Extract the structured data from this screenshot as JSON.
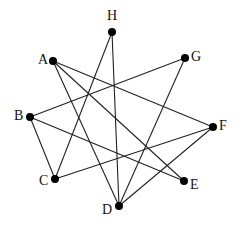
{
  "graph": {
    "nodes": [
      {
        "id": "H",
        "label": "H",
        "x": 112,
        "y": 32,
        "label_dx": -5,
        "label_dy": -23
      },
      {
        "id": "A",
        "label": "A",
        "x": 53,
        "y": 61,
        "label_dx": -15,
        "label_dy": -8
      },
      {
        "id": "G",
        "label": "G",
        "x": 185,
        "y": 58,
        "label_dx": 6,
        "label_dy": -8
      },
      {
        "id": "B",
        "label": "B",
        "x": 30,
        "y": 117,
        "label_dx": -16,
        "label_dy": -8
      },
      {
        "id": "F",
        "label": "F",
        "x": 213,
        "y": 127,
        "label_dx": 6,
        "label_dy": -8
      },
      {
        "id": "C",
        "label": "C",
        "x": 55,
        "y": 179,
        "label_dx": -16,
        "label_dy": -5
      },
      {
        "id": "E",
        "label": "E",
        "x": 184,
        "y": 181,
        "label_dx": 6,
        "label_dy": -3
      },
      {
        "id": "D",
        "label": "D",
        "x": 119,
        "y": 206,
        "label_dx": -17,
        "label_dy": -3
      }
    ],
    "edges": [
      [
        "A",
        "E"
      ],
      [
        "A",
        "F"
      ],
      [
        "A",
        "D"
      ],
      [
        "H",
        "C"
      ],
      [
        "H",
        "D"
      ],
      [
        "G",
        "B"
      ],
      [
        "G",
        "D"
      ],
      [
        "B",
        "C"
      ],
      [
        "B",
        "E"
      ],
      [
        "C",
        "F"
      ],
      [
        "F",
        "D"
      ]
    ],
    "node_radius": 4,
    "edge_color": "#222222",
    "node_color": "#000000"
  }
}
